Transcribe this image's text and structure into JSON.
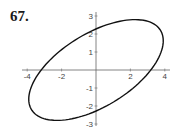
{
  "exercise_label": "67.",
  "chart_data": {
    "type": "line",
    "title": "",
    "xlabel": "",
    "ylabel": "",
    "xlim": [
      -4.3,
      4.3
    ],
    "ylim": [
      -3.2,
      3.2
    ],
    "x_ticks": [
      -4,
      -2,
      2,
      4
    ],
    "y_ticks": [
      -3,
      -2,
      -1,
      1,
      2,
      3
    ],
    "x_tick_labels": [
      "-4",
      "-2",
      "2",
      "4"
    ],
    "y_tick_labels": [
      "-3",
      "-2",
      "-1",
      "1",
      "2",
      "3"
    ],
    "grid": false,
    "series": [
      {
        "name": "ellipse",
        "points": [
          [
            -3.6,
            0
          ],
          [
            -3.9,
            -1
          ],
          [
            -3.8,
            -1.8
          ],
          [
            -3.2,
            -2.5
          ],
          [
            -2,
            -3
          ],
          [
            0,
            -2.7
          ],
          [
            2,
            -1.7
          ],
          [
            3.6,
            0
          ],
          [
            3.9,
            1
          ],
          [
            3.8,
            1.8
          ],
          [
            3.2,
            2.5
          ],
          [
            2,
            3
          ],
          [
            0,
            2.7
          ],
          [
            -2,
            1.7
          ],
          [
            -3.6,
            0
          ]
        ]
      }
    ],
    "intercepts": {
      "x": [
        -3.6,
        3.6
      ],
      "y": [
        -2.7,
        2.7
      ]
    }
  }
}
